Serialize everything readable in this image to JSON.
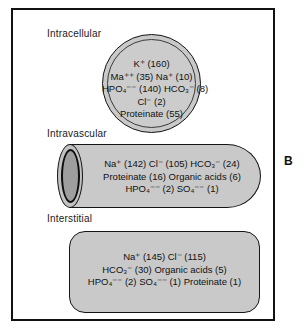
{
  "figure": {
    "panel_letter": "B"
  },
  "compartments": [
    {
      "id": "intracellular",
      "label": "Intracellular",
      "shape": "double-circle",
      "lines": [
        "K⁺ (160)",
        "Ma⁺⁺ (35) Na⁺ (10)",
        "HPO₄⁻⁻ (140) HCO₃⁻ (8)",
        "Cl⁻ (2)",
        "Proteinate (55)"
      ],
      "solutes": [
        {
          "name": "K+",
          "value": 160
        },
        {
          "name": "Ma++",
          "value": 35
        },
        {
          "name": "Na+",
          "value": 10
        },
        {
          "name": "HPO4--",
          "value": 140
        },
        {
          "name": "HCO3-",
          "value": 8
        },
        {
          "name": "Cl-",
          "value": 2
        },
        {
          "name": "Proteinate",
          "value": 55
        }
      ]
    },
    {
      "id": "intravascular",
      "label": "Intravascular",
      "shape": "cylinder",
      "lines": [
        "Na⁺ (142) Cl⁻ (105) HCO₃⁻ (24)",
        "Proteinate (16) Organic acids (6)",
        "HPO₄⁻⁻ (2) SO₄⁻⁻ (1)"
      ],
      "solutes": [
        {
          "name": "Na+",
          "value": 142
        },
        {
          "name": "Cl-",
          "value": 105
        },
        {
          "name": "HCO3-",
          "value": 24
        },
        {
          "name": "Proteinate",
          "value": 16
        },
        {
          "name": "Organic acids",
          "value": 6
        },
        {
          "name": "HPO4--",
          "value": 2
        },
        {
          "name": "SO4--",
          "value": 1
        }
      ]
    },
    {
      "id": "interstitial",
      "label": "Interstitial",
      "shape": "rounded-rectangle",
      "lines": [
        "Na⁺ (145) Cl⁻ (115)",
        "HCO₃⁻ (30) Organic acids (5)",
        "HPO₄⁻⁻ (2) SO₄⁻⁻ (1) Proteinate (1)"
      ],
      "solutes": [
        {
          "name": "Na+",
          "value": 145
        },
        {
          "name": "Cl-",
          "value": 115
        },
        {
          "name": "HCO3-",
          "value": 30
        },
        {
          "name": "Organic acids",
          "value": 5
        },
        {
          "name": "HPO4--",
          "value": 2
        },
        {
          "name": "SO4--",
          "value": 1
        },
        {
          "name": "Proteinate",
          "value": 1
        }
      ]
    }
  ],
  "colors": {
    "shape_fill": "#c9c9c9",
    "outline": "#151515",
    "frame": "#121212",
    "text": "#111111",
    "cylinder_cap_inner": "#9e9e9e"
  }
}
